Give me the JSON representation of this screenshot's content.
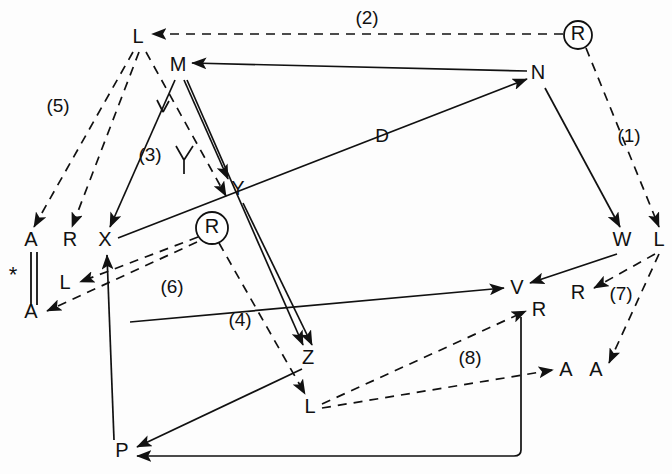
{
  "figure": {
    "kind": "graph-diagram",
    "width": 672,
    "height": 474,
    "background": "#ffffff",
    "ink_color": "#111111"
  },
  "nodes": [
    {
      "id": "L-top",
      "label": "L",
      "x": 138,
      "y": 38,
      "ringed": false
    },
    {
      "id": "M",
      "label": "M",
      "x": 178,
      "y": 66,
      "ringed": false
    },
    {
      "id": "R-top",
      "label": "R",
      "x": 578,
      "y": 35,
      "ringed": true
    },
    {
      "id": "N",
      "label": "N",
      "x": 538,
      "y": 74,
      "ringed": false
    },
    {
      "id": "Y",
      "label": "Y",
      "x": 238,
      "y": 190,
      "ringed": false
    },
    {
      "id": "R-mid",
      "label": "R",
      "x": 212,
      "y": 228,
      "ringed": true
    },
    {
      "id": "A-upper",
      "label": "A",
      "x": 31,
      "y": 241,
      "ringed": false
    },
    {
      "id": "R-left",
      "label": "R",
      "x": 70,
      "y": 241,
      "ringed": false
    },
    {
      "id": "X",
      "label": "X",
      "x": 105,
      "y": 241,
      "ringed": false
    },
    {
      "id": "W",
      "label": "W",
      "x": 622,
      "y": 241,
      "ringed": false
    },
    {
      "id": "L-right",
      "label": "L",
      "x": 659,
      "y": 241,
      "ringed": false
    },
    {
      "id": "L-left",
      "label": "L",
      "x": 65,
      "y": 284,
      "ringed": false
    },
    {
      "id": "A-lower",
      "label": "A",
      "x": 31,
      "y": 313,
      "ringed": false
    },
    {
      "id": "V",
      "label": "V",
      "x": 517,
      "y": 289,
      "ringed": false
    },
    {
      "id": "R-v",
      "label": "R",
      "x": 539,
      "y": 311,
      "ringed": false
    },
    {
      "id": "R-right",
      "label": "R",
      "x": 578,
      "y": 294,
      "ringed": false
    },
    {
      "id": "Z",
      "label": "Z",
      "x": 308,
      "y": 359,
      "ringed": false
    },
    {
      "id": "A-left2",
      "label": "A",
      "x": 566,
      "y": 371,
      "ringed": false
    },
    {
      "id": "A-right2",
      "label": "A",
      "x": 596,
      "y": 371,
      "ringed": false
    },
    {
      "id": "L-bottom",
      "label": "L",
      "x": 310,
      "y": 408,
      "ringed": false
    },
    {
      "id": "P",
      "label": "P",
      "x": 122,
      "y": 452,
      "ringed": false
    }
  ],
  "edge_labels": [
    {
      "id": "lbl-2",
      "text": "(2)",
      "x": 367,
      "y": 19
    },
    {
      "id": "lbl-5",
      "text": "(5)",
      "x": 58,
      "y": 107
    },
    {
      "id": "lbl-1",
      "text": "(1)",
      "x": 629,
      "y": 137
    },
    {
      "id": "lbl-3",
      "text": "(3)",
      "x": 150,
      "y": 156
    },
    {
      "id": "lbl-D",
      "text": "D",
      "x": 382,
      "y": 137
    },
    {
      "id": "lbl-Y-cross",
      "text": "Y",
      "x": 184,
      "y": 158
    },
    {
      "id": "lbl-6",
      "text": "(6)",
      "x": 172,
      "y": 288
    },
    {
      "id": "lbl-4",
      "text": "(4)",
      "x": 240,
      "y": 321
    },
    {
      "id": "lbl-7",
      "text": "(7)",
      "x": 621,
      "y": 295
    },
    {
      "id": "lbl-8",
      "text": "(8)",
      "x": 470,
      "y": 359
    },
    {
      "id": "lbl-star",
      "text": "*",
      "x": 13,
      "y": 276
    }
  ],
  "edges": [
    {
      "id": "e-R-to-L-top",
      "style": "dashed",
      "from": "R-top",
      "to": "L-top",
      "label": "(2)",
      "arrow": "end"
    },
    {
      "id": "e-N-to-M",
      "style": "solid",
      "from": "N",
      "to": "M",
      "label": "",
      "arrow": "end"
    },
    {
      "id": "e-R-to-L-right",
      "style": "dashed",
      "from": "R-top",
      "to": "L-right",
      "label": "(1)",
      "arrow": "end"
    },
    {
      "id": "e-N-to-W",
      "style": "solid",
      "from": "N",
      "to": "W",
      "label": "",
      "arrow": "end"
    },
    {
      "id": "e-X-to-N",
      "style": "solid",
      "from": "X",
      "to": "N",
      "label": "D",
      "arrow": "end"
    },
    {
      "id": "e-L-to-A-upper",
      "style": "dashed",
      "from": "L-top",
      "to": "A-upper",
      "label": "(5)",
      "arrow": "end"
    },
    {
      "id": "e-L-to-R-left",
      "style": "dashed",
      "from": "L-top",
      "to": "R-left",
      "label": "(5)",
      "arrow": "end"
    },
    {
      "id": "e-L-to-Y-cross",
      "style": "dashed",
      "from": "L-top",
      "to": "Y",
      "label": "(3)",
      "arrow": "end"
    },
    {
      "id": "e-M-to-X",
      "style": "solid",
      "from": "M",
      "to": "X",
      "label": "",
      "arrow": "end"
    },
    {
      "id": "e-M-to-Y",
      "style": "solid",
      "from": "M",
      "to": "Y",
      "label": "",
      "arrow": "end"
    },
    {
      "id": "e-M-to-Z",
      "style": "solid",
      "from": "M",
      "to": "Z",
      "label": "",
      "arrow": "end"
    },
    {
      "id": "e-Y-to-Z",
      "style": "solid",
      "from": "Y",
      "to": "Z",
      "label": "",
      "arrow": "end"
    },
    {
      "id": "e-Rmid-to-L-left",
      "style": "dashed",
      "from": "R-mid",
      "to": "L-left",
      "label": "(6)",
      "arrow": "end"
    },
    {
      "id": "e-Rmid-to-A-low",
      "style": "dashed",
      "from": "R-mid",
      "to": "A-lower",
      "label": "(6)",
      "arrow": "end"
    },
    {
      "id": "e-Rmid-to-Lbot",
      "style": "dashed",
      "from": "R-mid",
      "to": "L-bottom",
      "label": "(4)",
      "arrow": "end"
    },
    {
      "id": "e-P-to-X",
      "style": "solid",
      "from": "P",
      "to": "X",
      "label": "",
      "arrow": "end"
    },
    {
      "id": "e-Z-to-P",
      "style": "solid",
      "from": "Z",
      "to": "P",
      "label": "",
      "arrow": "end"
    },
    {
      "id": "e-W-to-V",
      "style": "solid",
      "from": "W",
      "to": "V",
      "label": "",
      "arrow": "end"
    },
    {
      "id": "e-Z-to-V",
      "style": "solid",
      "from": "Z",
      "to": "V",
      "label": "",
      "arrow": "end"
    },
    {
      "id": "e-Lright-to-R",
      "style": "dashed",
      "from": "L-right",
      "to": "R-right",
      "label": "(7)",
      "arrow": "end"
    },
    {
      "id": "e-Lright-to-A",
      "style": "dashed",
      "from": "L-right",
      "to": "A-right2",
      "label": "(7)",
      "arrow": "end"
    },
    {
      "id": "e-Lbot-to-Rv",
      "style": "dashed",
      "from": "L-bottom",
      "to": "R-v",
      "label": "(8)",
      "arrow": "end"
    },
    {
      "id": "e-Lbot-to-A",
      "style": "dashed",
      "from": "L-bottom",
      "to": "A-left2",
      "label": "(8)",
      "arrow": "end"
    },
    {
      "id": "e-Rv-to-P",
      "style": "solid",
      "from": "R-v",
      "to": "P",
      "label": "",
      "arrow": "end"
    }
  ],
  "marks": {
    "double_bar": {
      "id": "double-bar",
      "x1": 31,
      "x2": 37,
      "y_top": 252,
      "y_bottom": 305
    },
    "asterisk": "*"
  }
}
